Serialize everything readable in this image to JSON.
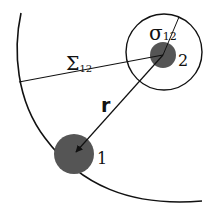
{
  "diagram": {
    "labels": {
      "sigma": "σ",
      "sigma_sub": "12",
      "Sigma": "Σ",
      "Sigma_sub": "12",
      "r": "r",
      "particle1": "1",
      "particle2": "2"
    },
    "colors": {
      "particle_fill": "#555555",
      "line": "#111111",
      "background": "#ffffff"
    }
  }
}
